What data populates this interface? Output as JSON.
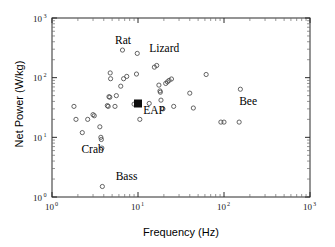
{
  "chart_data": {
    "type": "scatter",
    "title": "",
    "xlabel": "Frequency (Hz)",
    "ylabel": "Net Power (W/kg)",
    "xscale": "log",
    "yscale": "log",
    "xlim": [
      1,
      1000
    ],
    "ylim": [
      1,
      1000
    ],
    "xticks": [
      1,
      10,
      100,
      1000
    ],
    "xtick_labels": [
      "10",
      "10",
      "10",
      "10"
    ],
    "xtick_exponents": [
      "0",
      "1",
      "2",
      "3"
    ],
    "yticks": [
      1,
      10,
      100,
      1000
    ],
    "ytick_labels": [
      "10",
      "10",
      "10",
      "10"
    ],
    "ytick_exponents": [
      "0",
      "1",
      "2",
      "3"
    ],
    "grid": false,
    "legend": "none",
    "series": [
      {
        "name": "Biological actuators",
        "marker": "open-circle",
        "color": "#4a4a4a",
        "points": [
          [
            1.8,
            33
          ],
          [
            1.9,
            20
          ],
          [
            2.25,
            12
          ],
          [
            2.6,
            20
          ],
          [
            3.0,
            24
          ],
          [
            3.1,
            23
          ],
          [
            3.6,
            15
          ],
          [
            3.7,
            10
          ],
          [
            3.75,
            9.2
          ],
          [
            3.8,
            6.6
          ],
          [
            3.85,
            1.5
          ],
          [
            4.4,
            34
          ],
          [
            4.5,
            33
          ],
          [
            4.6,
            48
          ],
          [
            4.7,
            47
          ],
          [
            4.75,
            120
          ],
          [
            4.8,
            96
          ],
          [
            5.4,
            33
          ],
          [
            5.6,
            50
          ],
          [
            6.3,
            72
          ],
          [
            6.6,
            290
          ],
          [
            6.8,
            96
          ],
          [
            7.4,
            105
          ],
          [
            9.0,
            36
          ],
          [
            9.6,
            115
          ],
          [
            9.8,
            255
          ],
          [
            10.5,
            20
          ],
          [
            13.5,
            37
          ],
          [
            15.5,
            150
          ],
          [
            16.5,
            160
          ],
          [
            17.5,
            75
          ],
          [
            18.0,
            60
          ],
          [
            18.2,
            57
          ],
          [
            18.5,
            42
          ],
          [
            19.5,
            30
          ],
          [
            21.0,
            80
          ],
          [
            22.0,
            85
          ],
          [
            23.0,
            90
          ],
          [
            24.5,
            95
          ],
          [
            26.0,
            33
          ],
          [
            40.0,
            55
          ],
          [
            44.0,
            31
          ],
          [
            62.0,
            113
          ],
          [
            92.0,
            18
          ],
          [
            100.0,
            18
          ],
          [
            150.0,
            18
          ],
          [
            155.0,
            64
          ]
        ]
      },
      {
        "name": "EAP",
        "marker": "filled-square",
        "color": "#0d0d0d",
        "points": [
          [
            10.0,
            37
          ]
        ]
      }
    ],
    "annotations": [
      {
        "text": "Rat",
        "x": 5.4,
        "y": 400
      },
      {
        "text": "Lizard",
        "x": 13.5,
        "y": 290
      },
      {
        "text": "Bee",
        "x": 150.0,
        "y": 38
      },
      {
        "text": "EAP",
        "x": 11.5,
        "y": 27
      },
      {
        "text": "Crab",
        "x": 2.2,
        "y": 6.0
      },
      {
        "text": "Bass",
        "x": 5.5,
        "y": 2.1
      }
    ]
  }
}
